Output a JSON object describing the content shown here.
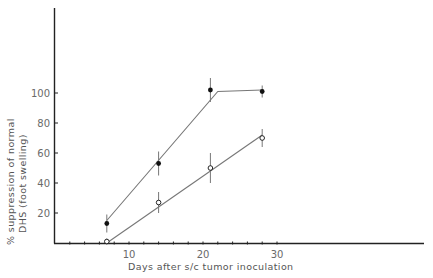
{
  "chart_data": {
    "type": "line",
    "title": "",
    "xlabel": "Days after s/c tumor inoculation",
    "ylabel_line1": "% suppression of normal",
    "ylabel_line2": "DHS (foot swelling)",
    "ylabel": "% suppression of normal DHS (foot swelling)",
    "xlim": [
      0,
      50
    ],
    "ylim": [
      0,
      160
    ],
    "xticks": [
      10,
      20,
      30
    ],
    "yticks": [
      20,
      40,
      60,
      80,
      100
    ],
    "grid": false,
    "legend": null,
    "series": [
      {
        "name": "filled circles",
        "marker": "filled-circle",
        "x": [
          7,
          14,
          21,
          28
        ],
        "values": [
          13,
          53,
          102,
          101
        ],
        "error": [
          6,
          8,
          8,
          4
        ],
        "fit_line": [
          [
            7,
            15
          ],
          [
            22,
            101
          ],
          [
            28,
            102
          ]
        ]
      },
      {
        "name": "open circles",
        "marker": "open-circle",
        "x": [
          7,
          14,
          21,
          28
        ],
        "values": [
          1,
          27,
          50,
          70
        ],
        "error": [
          2,
          7,
          10,
          6
        ],
        "fit_line": [
          [
            7,
            0
          ],
          [
            28,
            72
          ]
        ]
      }
    ]
  },
  "colors": {
    "axis": "#222222",
    "line": "#777777",
    "marker": "#111111",
    "text": "#666666"
  }
}
